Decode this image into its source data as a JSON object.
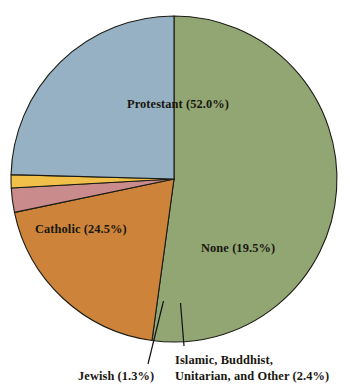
{
  "chart_data": {
    "type": "pie",
    "title": "",
    "subtitle": "",
    "xlabel": "",
    "ylabel": "",
    "legend_position": "none",
    "grid": false,
    "labels_inline": true,
    "units": "percent",
    "categories": [
      "Protestant",
      "None",
      "Islamic, Buddhist, Unitarian, and Other",
      "Jewish",
      "Catholic"
    ],
    "values": [
      52.0,
      19.5,
      2.4,
      1.3,
      24.5
    ],
    "slices": [
      {
        "name": "Protestant",
        "value": 52.0,
        "label": "Protestant (52.0%)",
        "color": "#91a673",
        "label_placement": "inside"
      },
      {
        "name": "None",
        "value": 19.5,
        "label": "None (19.5%)",
        "color": "#cd8339",
        "label_placement": "inside"
      },
      {
        "name": "Islamic, Buddhist, Unitarian, and Other",
        "value": 2.4,
        "label_line1": "Islamic, Buddhist,",
        "label_line2": "Unitarian, and Other (2.4%)",
        "color": "#c98b8b",
        "label_placement": "callout"
      },
      {
        "name": "Jewish",
        "value": 1.3,
        "label": "Jewish (1.3%)",
        "color": "#f0c04a",
        "label_placement": "callout"
      },
      {
        "name": "Catholic",
        "value": 24.5,
        "label": "Catholic (24.5%)",
        "color": "#96b1c4",
        "label_placement": "inside"
      }
    ]
  },
  "colors": {
    "background": "#ffffff",
    "outline": "#1b1b14",
    "text": "#19170f",
    "protestant": "#91a673",
    "catholic": "#96b1c4",
    "none": "#cd8339",
    "jewish": "#f0c04a",
    "other": "#c98b8b"
  },
  "labels": {
    "protestant": "Protestant (52.0%)",
    "catholic": "Catholic (24.5%)",
    "none": "None (19.5%)",
    "jewish": "Jewish (1.3%)",
    "other_line1": "Islamic, Buddhist,",
    "other_line2": "Unitarian, and Other (2.4%)"
  }
}
